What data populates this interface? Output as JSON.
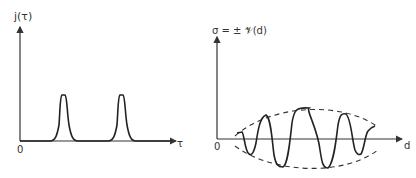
{
  "left_plot": {
    "y_label": "j(τ)",
    "x_label": "τ",
    "origin_label": "0",
    "peaks": [
      {
        "x": 64,
        "top": 95
      },
      {
        "x": 124,
        "top": 95
      }
    ]
  },
  "right_plot": {
    "y_label": "σ = ± 𝒱(d)",
    "x_label": "d",
    "origin_label": "0",
    "envelope": "dashed",
    "oscillation_cycles": 4
  }
}
